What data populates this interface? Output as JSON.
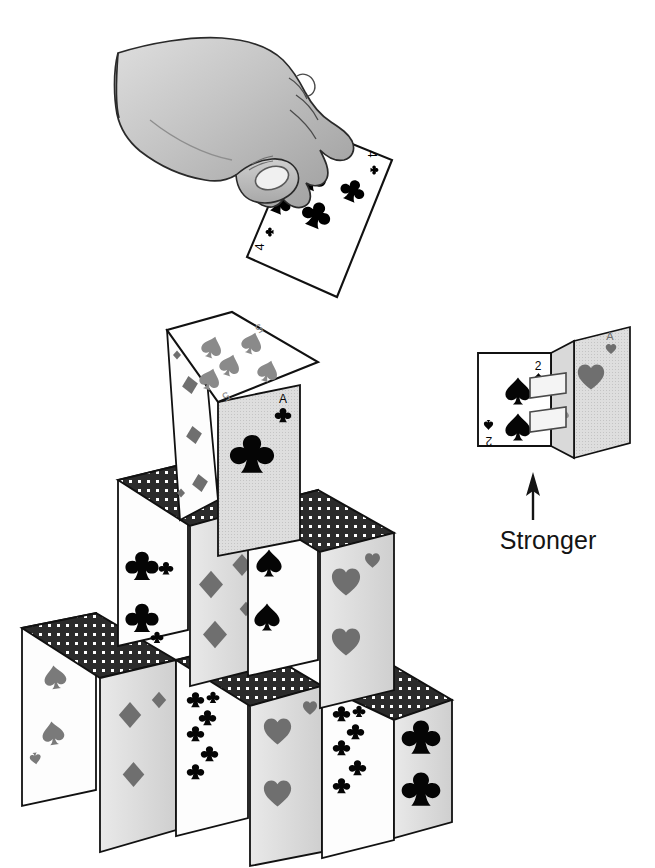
{
  "figure": {
    "background_color": "#ffffff",
    "ink_color": "#111111"
  },
  "annotations": {
    "stronger_label": "Stronger",
    "arrow": {
      "name": "up-arrow",
      "direction": "up"
    }
  },
  "hand_panel": {
    "name": "hand-holding-card",
    "skin_fill": "#c9c9c9",
    "held_card": {
      "rank": "4",
      "suit": "clubs",
      "suit_glyph": "♣",
      "pip_count": 4,
      "pip_color": "#000000",
      "face_color": "#ffffff",
      "corner_rank_top": "4",
      "corner_rank_bottom": "4"
    }
  },
  "folded_pair": {
    "name": "folded-card-pair",
    "left_card": {
      "rank": "2",
      "suit": "spades",
      "suit_glyph": "♠",
      "pip_count": 2,
      "pip_color": "#000000",
      "face_color": "#ffffff",
      "corner_rank_top": "2",
      "corner_rank_bottom": "2"
    },
    "right_card": {
      "rank": "A",
      "suit": "hearts",
      "suit_glyph": "♥",
      "pip_count": 1,
      "pip_color": "#808080",
      "face_color": "#e6e6e6",
      "corner_rank_top": "A",
      "corner_rank_bottom": "A"
    },
    "slots": [
      {
        "name": "upper-slot",
        "label": "slot"
      },
      {
        "name": "lower-slot",
        "label": "slot"
      }
    ]
  },
  "card_house": {
    "name": "house-of-cards",
    "levels": 3,
    "card_back": {
      "name": "card-back",
      "fill": "#2b2b2b",
      "dot_color": "#ffffff",
      "pattern": "dotted-grid"
    },
    "level_top": {
      "roof_card": {
        "rank": "5",
        "suit": "spades",
        "suit_glyph": "♠",
        "pip_count": 5,
        "pip_color": "#7a7a7a",
        "face_color": "#ffffff"
      },
      "front_card": {
        "rank": "A",
        "suit": "clubs",
        "suit_glyph": "♣",
        "pip_count": 1,
        "pip_color": "#000000",
        "face_color": "#dcdcdc"
      },
      "side_card": {
        "rank": "5",
        "suit": "diamonds",
        "suit_glyph": "♦",
        "pip_count": 5,
        "pip_color": "#7a7a7a",
        "face_color": "#ffffff"
      }
    },
    "level_middle": {
      "roofs": [
        "card-back",
        "card-back"
      ],
      "panels": [
        {
          "rank": "3",
          "suit": "clubs",
          "suit_glyph": "♣",
          "pip_count": 3,
          "pip_color": "#000000",
          "face_color": "#ffffff"
        },
        {
          "rank": "4",
          "suit": "diamonds",
          "suit_glyph": "♦",
          "pip_count": 4,
          "pip_color": "#7a7a7a",
          "face_color": "#dcdcdc"
        },
        {
          "rank": "2",
          "suit": "spades",
          "suit_glyph": "♠",
          "pip_count": 2,
          "pip_color": "#000000",
          "face_color": "#ffffff"
        },
        {
          "rank": "3",
          "suit": "hearts",
          "suit_glyph": "♥",
          "pip_count": 3,
          "pip_color": "#7a7a7a",
          "face_color": "#dcdcdc"
        }
      ]
    },
    "level_bottom": {
      "roofs": [
        "card-back",
        "card-back",
        "card-back"
      ],
      "panels": [
        {
          "rank": "3",
          "suit": "spades",
          "suit_glyph": "♠",
          "pip_count": 3,
          "pip_color": "#7a7a7a",
          "face_color": "#ffffff"
        },
        {
          "rank": "2",
          "suit": "diamonds",
          "suit_glyph": "♦",
          "pip_count": 2,
          "pip_color": "#7a7a7a",
          "face_color": "#dcdcdc"
        },
        {
          "rank": "6",
          "suit": "clubs",
          "suit_glyph": "♣",
          "pip_count": 6,
          "pip_color": "#000000",
          "face_color": "#ffffff"
        },
        {
          "rank": "2",
          "suit": "hearts",
          "suit_glyph": "♥",
          "pip_count": 2,
          "pip_color": "#7a7a7a",
          "face_color": "#dcdcdc"
        },
        {
          "rank": "6",
          "suit": "clubs",
          "suit_glyph": "♣",
          "pip_count": 6,
          "pip_color": "#000000",
          "face_color": "#ffffff"
        },
        {
          "rank": "2",
          "suit": "clubs",
          "suit_glyph": "♣",
          "pip_count": 2,
          "pip_color": "#000000",
          "face_color": "#dcdcdc"
        }
      ]
    }
  }
}
